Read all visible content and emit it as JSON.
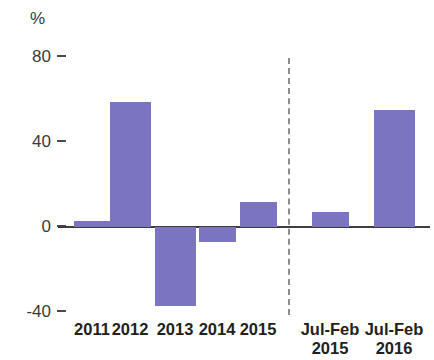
{
  "chart_data": {
    "type": "bar",
    "title": "",
    "subtitle": "",
    "xlabel": "",
    "ylabel": "%",
    "unit_label": "%",
    "ylim": [
      -48,
      86
    ],
    "yticks": [
      80,
      40,
      0,
      -40
    ],
    "ytick_labels": [
      "80",
      "40",
      "0",
      "-40"
    ],
    "grid": false,
    "legend": null,
    "bar_color": "#7b74c0",
    "axis_color": "#3d3d3d",
    "divider": {
      "present": true,
      "style": "dashed",
      "after_category": "2015",
      "color": "#8d8d8d"
    },
    "categories": [
      "2011",
      "2012",
      "2013",
      "2014",
      "2015",
      "Jul-Feb 2015",
      "Jul-Feb 2016"
    ],
    "category_labels": [
      {
        "line1": "2011",
        "line2": ""
      },
      {
        "line1": "2012",
        "line2": ""
      },
      {
        "line1": "2013",
        "line2": ""
      },
      {
        "line1": "2014",
        "line2": ""
      },
      {
        "line1": "2015",
        "line2": ""
      },
      {
        "line1": "Jul-Feb",
        "line2": "2015"
      },
      {
        "line1": "Jul-Feb",
        "line2": "2016"
      }
    ],
    "values": [
      3,
      59,
      -37,
      -7,
      12,
      7,
      55
    ],
    "series": [
      {
        "name": "",
        "values": [
          3,
          59,
          -37,
          -7,
          12,
          7,
          55
        ]
      }
    ]
  }
}
